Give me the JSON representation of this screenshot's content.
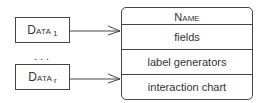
{
  "sources": [
    {
      "label": "Data",
      "subscript": "1"
    },
    {
      "label": "Data",
      "subscript": "r"
    }
  ],
  "ellipsis": "...",
  "entity": {
    "title": "Name",
    "rows": [
      "fields",
      "label generators",
      "interaction chart"
    ]
  },
  "colors": {
    "stroke": "#444444",
    "text": "#333333",
    "background": "#ffffff"
  }
}
